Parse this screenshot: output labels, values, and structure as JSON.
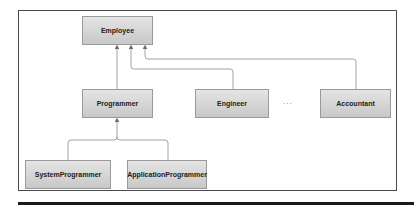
{
  "diagram": {
    "type": "class-inheritance",
    "nodes": [
      {
        "id": "employee",
        "label": "Employee"
      },
      {
        "id": "programmer",
        "label": "Programmer"
      },
      {
        "id": "engineer",
        "label": "Engineer"
      },
      {
        "id": "accountant",
        "label": "Accountant"
      },
      {
        "id": "system_programmer",
        "label": "SystemProgrammer"
      },
      {
        "id": "application_programmer",
        "label": "ApplicationProgrammer"
      }
    ],
    "ellipsis": "...",
    "edges": [
      {
        "from": "programmer",
        "to": "employee"
      },
      {
        "from": "engineer",
        "to": "employee"
      },
      {
        "from": "accountant",
        "to": "employee"
      },
      {
        "from": "system_programmer",
        "to": "programmer"
      },
      {
        "from": "application_programmer",
        "to": "programmer"
      }
    ],
    "colors": {
      "line": "#8a8a8a",
      "frame": "#4a4a4a",
      "node_fill": "#d6d6d6"
    }
  }
}
